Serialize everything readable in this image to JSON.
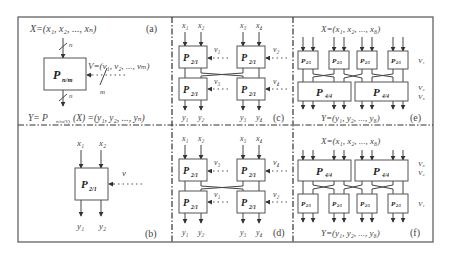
{
  "panels": {
    "a": {
      "label": "(a)",
      "input": "X=(x₁, x₂, ..., xₙ)",
      "block": "P",
      "block_sub": "n/m",
      "bus_in": "n",
      "bus_out": "n",
      "key_bus": "m",
      "key": "V=(v₁, v₂, ..., vₘ)",
      "output_prefix": "Y= P",
      "output_sub": "n/m(V)",
      "output_suffix": "(X) =(y₁, y₂, ..., yₙ)"
    },
    "b": {
      "label": "(b)",
      "inputs": [
        "x₁",
        "x₂"
      ],
      "outputs": [
        "y₁",
        "y₂"
      ],
      "block": "P",
      "block_sub": "2/1",
      "key": "v"
    },
    "c": {
      "label": "(c)",
      "inputs": [
        "x₁",
        "x₂",
        "x₃",
        "x₄"
      ],
      "outputs": [
        "y₁",
        "y₂",
        "y₃",
        "y₄"
      ],
      "block": "P",
      "block_sub": "2/1",
      "keys": [
        "v₁",
        "v₂",
        "v₃",
        "v₄"
      ]
    },
    "d": {
      "label": "(d)",
      "inputs": [
        "x₁",
        "x₂",
        "x₃",
        "x₄"
      ],
      "outputs": [
        "y₁",
        "y₂",
        "y₃",
        "y₄"
      ],
      "block": "P",
      "block_sub": "2/1",
      "keys": [
        "v₃",
        "v₄",
        "v₁",
        "v₂"
      ]
    },
    "e": {
      "label": "(e)",
      "input": "X=(x₁, x₂, ..., x₈)",
      "output": "Y=(y₁, y₂, ..., y₈)",
      "small_block": "P",
      "small_sub": "2/1",
      "big_block": "P",
      "big_sub": "4/4",
      "keys": [
        "V₁",
        "V₂",
        "V₃"
      ]
    },
    "f": {
      "label": "(f)",
      "input": "X=(x₁, x₂, ..., x₈)",
      "output": "Y=(y₁, y₂, ..., y₈)",
      "small_block": "P",
      "small_sub": "2/1",
      "big_block": "P",
      "big_sub": "4/4",
      "keys": [
        "V₃",
        "V₂",
        "V₁"
      ]
    }
  }
}
